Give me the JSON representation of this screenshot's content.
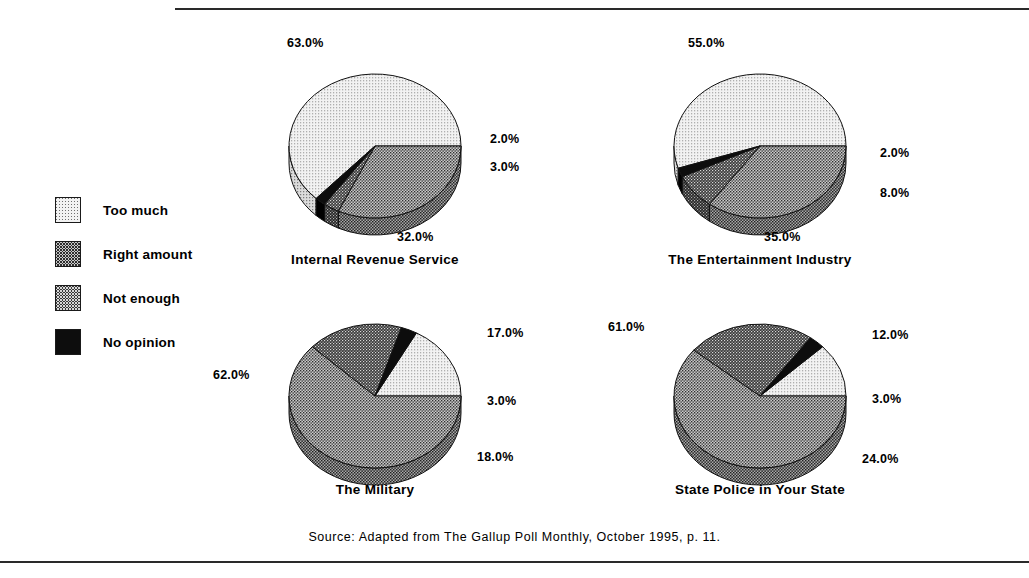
{
  "figure": {
    "source_note": "Source: Adapted from The Gallup Poll Monthly, October 1995, p.  11."
  },
  "legend": {
    "items": [
      {
        "label": "Too much",
        "pattern": "pat-toomuch",
        "color": "#f2f2f2"
      },
      {
        "label": "Right amount",
        "pattern": "pat-right",
        "color": "#c9c9c9"
      },
      {
        "label": "Not enough",
        "pattern": "pat-notenough",
        "color": "#3a3a3a"
      },
      {
        "label": "No opinion",
        "pattern": "pat-noopinion",
        "color": "#0d0d0d"
      }
    ]
  },
  "chart_data": {
    "type": "pie",
    "title": "",
    "legend_position": "left",
    "categories": [
      "Too much",
      "Right amount",
      "Not enough",
      "No opinion"
    ],
    "category_colors": [
      "#f2f2f2",
      "#c9c9c9",
      "#3a3a3a",
      "#0d0d0d"
    ],
    "unit": "%",
    "panels": [
      {
        "title": "Internal Revenue Service",
        "values": [
          63.0,
          32.0,
          3.0,
          2.0
        ],
        "labels": [
          "63.0%",
          "32.0%",
          "3.0%",
          "2.0%"
        ]
      },
      {
        "title": "The Entertainment Industry",
        "values": [
          55.0,
          35.0,
          8.0,
          2.0
        ],
        "labels": [
          "55.0%",
          "35.0%",
          "8.0%",
          "2.0%"
        ]
      },
      {
        "title": "The Military",
        "values": [
          17.0,
          62.0,
          18.0,
          3.0
        ],
        "labels": [
          "17.0%",
          "62.0%",
          "18.0%",
          "3.0%"
        ]
      },
      {
        "title": "State Police in Your State",
        "values": [
          12.0,
          61.0,
          24.0,
          3.0
        ],
        "labels": [
          "12.0%",
          "61.0%",
          "24.0%",
          "3.0%"
        ]
      }
    ]
  },
  "panel_layout": [
    {
      "left": 255,
      "top": 38,
      "cx": 120,
      "cy": 108,
      "rx": 86,
      "ry": 72,
      "depth": 17,
      "title_top": 214,
      "label_pos": [
        {
          "x": 32,
          "y": -2
        },
        {
          "x": 142,
          "y": 192
        },
        {
          "x": 235,
          "y": 122
        },
        {
          "x": 235,
          "y": 94
        }
      ]
    },
    {
      "left": 640,
      "top": 38,
      "cx": 120,
      "cy": 108,
      "rx": 86,
      "ry": 72,
      "depth": 17,
      "title_top": 214,
      "label_pos": [
        {
          "x": 48,
          "y": -2
        },
        {
          "x": 124,
          "y": 192
        },
        {
          "x": 240,
          "y": 148
        },
        {
          "x": 240,
          "y": 108
        }
      ]
    },
    {
      "left": 255,
      "top": 310,
      "cx": 120,
      "cy": 86,
      "rx": 86,
      "ry": 72,
      "depth": 17,
      "title_top": 172,
      "label_pos": [
        {
          "x": 232,
          "y": 16
        },
        {
          "x": -42,
          "y": 58
        },
        {
          "x": 222,
          "y": 140
        },
        {
          "x": 232,
          "y": 84
        }
      ]
    },
    {
      "left": 640,
      "top": 310,
      "cx": 120,
      "cy": 86,
      "rx": 86,
      "ry": 72,
      "depth": 17,
      "title_top": 172,
      "label_pos": [
        {
          "x": 232,
          "y": 18
        },
        {
          "x": -32,
          "y": 10
        },
        {
          "x": 222,
          "y": 142
        },
        {
          "x": 232,
          "y": 82
        }
      ]
    }
  ]
}
